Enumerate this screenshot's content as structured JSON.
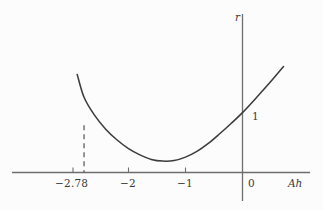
{
  "chart_data": {
    "type": "line",
    "title": "",
    "subtitle": "",
    "xlabel": "Ah",
    "ylabel": "r",
    "xlim": [
      -3.05,
      1.2
    ],
    "ylim": [
      -0.35,
      2.05
    ],
    "grid": false,
    "legend": null,
    "x_ticks": [
      {
        "value": -2.78,
        "label": "−2.78"
      },
      {
        "value": -2,
        "label": "−2"
      },
      {
        "value": -1,
        "label": "−1"
      },
      {
        "value": 0,
        "label": "0"
      }
    ],
    "y_ticks": [],
    "annotations": [
      {
        "name": "y-intercept-value",
        "text": "1",
        "x": 0,
        "y": 1,
        "description": "value of r where the curve crosses the vertical axis"
      }
    ],
    "reference_lines": [
      {
        "name": "critical-point-dashed-line",
        "orientation": "vertical",
        "x": -2.78,
        "style": "dashed",
        "from_y": 0,
        "to_y": 0.83
      }
    ],
    "series": [
      {
        "name": "stability-curve",
        "style": "solid",
        "color": "#3c3c3c",
        "points": [
          {
            "x": -2.9,
            "y": 1.72
          },
          {
            "x": -2.78,
            "y": 1.32
          },
          {
            "x": -2.6,
            "y": 1.01
          },
          {
            "x": -2.4,
            "y": 0.76
          },
          {
            "x": -2.2,
            "y": 0.57
          },
          {
            "x": -2.0,
            "y": 0.42
          },
          {
            "x": -1.8,
            "y": 0.31
          },
          {
            "x": -1.6,
            "y": 0.23
          },
          {
            "x": -1.4,
            "y": 0.2
          },
          {
            "x": -1.2,
            "y": 0.21
          },
          {
            "x": -1.0,
            "y": 0.27
          },
          {
            "x": -0.8,
            "y": 0.37
          },
          {
            "x": -0.6,
            "y": 0.51
          },
          {
            "x": -0.4,
            "y": 0.68
          },
          {
            "x": -0.2,
            "y": 0.86
          },
          {
            "x": 0.0,
            "y": 1.05
          },
          {
            "x": 0.25,
            "y": 1.32
          },
          {
            "x": 0.5,
            "y": 1.6
          },
          {
            "x": 0.72,
            "y": 1.86
          }
        ]
      }
    ]
  },
  "axes": {
    "x_axis_name": "horizontal-axis",
    "y_axis_name": "vertical-axis",
    "x_label": "Ah",
    "y_label": "r"
  },
  "ticks": {
    "t0": "−2.78",
    "t1": "−2",
    "t2": "−1",
    "t3": "0"
  },
  "labels": {
    "y_intercept": "1",
    "x_axis": "Ah",
    "y_axis": "r"
  },
  "colors": {
    "background": "#fcfcfc",
    "ink": "#3a3a3a",
    "curve": "#3c3c3c",
    "axis": "#6e6e6e"
  }
}
